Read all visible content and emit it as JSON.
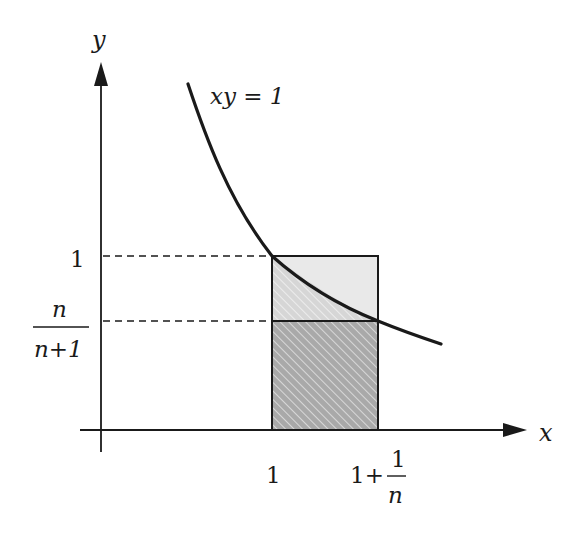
{
  "diagram": {
    "type": "function-area-diagram",
    "curve_label": "xy = 1",
    "axes": {
      "x_label": "x",
      "y_label": "y"
    },
    "x_ticks": {
      "one": "1",
      "one_plus_prefix": "1+",
      "frac_num": "1",
      "frac_den": "n"
    },
    "y_ticks": {
      "one": "1",
      "frac_num": "n",
      "frac_den": "n+1"
    },
    "colors": {
      "ink": "#1a1a1a",
      "light_fill": "#e8e8e8",
      "dark_fill": "#a8a8a8",
      "hatch": "#ffffff"
    },
    "regions": [
      {
        "name": "upper-rectangle",
        "from_y": "n/(n+1)",
        "to_y": "1",
        "fill": "light gray"
      },
      {
        "name": "lower-rectangle",
        "from_y": "0",
        "to_y": "n/(n+1)",
        "fill": "dark gray hatched"
      },
      {
        "name": "area-under-curve",
        "x_from": "1",
        "x_to": "1+1/n",
        "fill": "hatched"
      }
    ]
  }
}
